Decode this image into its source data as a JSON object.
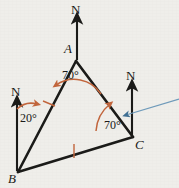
{
  "figure": {
    "background_color": "#efeeea",
    "stroke_color": "#1a1a18",
    "angle_color": "#c2653c",
    "tick_color": "#c2653c",
    "highlight_color": "#5b87a8",
    "vertices": [
      {
        "name": "A",
        "label": "A",
        "x": 76,
        "y": 61
      },
      {
        "name": "B",
        "label": "B",
        "x": 18,
        "y": 172
      },
      {
        "name": "C",
        "label": "C",
        "x": 133,
        "y": 137
      }
    ],
    "north_arrows": [
      {
        "name": "north-arrow-a",
        "label": "N",
        "base_x": 77,
        "base_y": 60,
        "tip_x": 77,
        "tip_y": 15
      },
      {
        "name": "north-arrow-b",
        "label": "N",
        "base_x": 17,
        "base_y": 171,
        "tip_x": 17,
        "tip_y": 98
      },
      {
        "name": "north-arrow-c",
        "label": "N",
        "base_x": 132,
        "base_y": 136,
        "tip_x": 132,
        "tip_y": 82
      }
    ],
    "angles": [
      {
        "name": "angle-at-a",
        "label": "70°",
        "value": 70,
        "unit": "degrees",
        "at_vertex": "A",
        "label_x": 62,
        "label_y": 76
      },
      {
        "name": "angle-at-b",
        "label": "20°",
        "value": 20,
        "unit": "degrees",
        "at_vertex": "B",
        "label_x": 22,
        "label_y": 117
      },
      {
        "name": "angle-at-c",
        "label": "70°",
        "value": 70,
        "unit": "degrees",
        "at_vertex": "C",
        "label_x": 106,
        "label_y": 124
      }
    ],
    "tick_marks": [
      {
        "name": "tick-side-ab",
        "side": "AB",
        "x": 49,
        "y": 103
      },
      {
        "name": "tick-side-bc",
        "side": "BC",
        "x": 74,
        "y": 151
      }
    ],
    "highlight_line": {
      "name": "highlight-line",
      "from_x": 124,
      "from_y": 116,
      "to_x": 179,
      "to_y": 99
    }
  }
}
